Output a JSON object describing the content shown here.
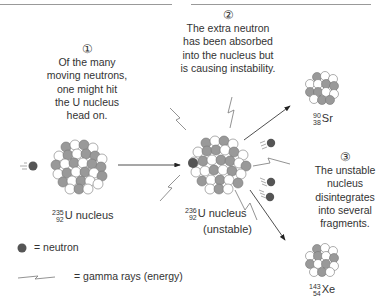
{
  "steps": [
    {
      "number": "①",
      "text": [
        "Of the many",
        "moving neutrons,",
        "one might hit",
        "the U nucleus",
        "head on."
      ]
    },
    {
      "number": "②",
      "text": [
        "The extra neutron",
        "has been absorbed",
        "into the nucleus but",
        "is causing instability."
      ]
    },
    {
      "number": "③",
      "text": [
        "The unstable",
        "nucleus",
        "disintegrates",
        "into several",
        "fragments."
      ]
    }
  ],
  "nuclei": {
    "u235": {
      "mass": "235",
      "atomic": "92",
      "label": "U nucleus",
      "note": ""
    },
    "u236": {
      "mass": "236",
      "atomic": "92",
      "label": "U nucleus",
      "note": "(unstable)"
    },
    "sr": {
      "mass": "90",
      "atomic": "38",
      "label": "Sr"
    },
    "xe": {
      "mass": "143",
      "atomic": "54",
      "label": "Xe"
    }
  },
  "legend": {
    "neutron": "= neutron",
    "gamma": "= gamma rays (energy)"
  },
  "colors": {
    "proton": "#ffffff",
    "neutron_in_nucleus": "#8c8c8c",
    "free_neutron": "#555555",
    "stroke": "#666666"
  }
}
